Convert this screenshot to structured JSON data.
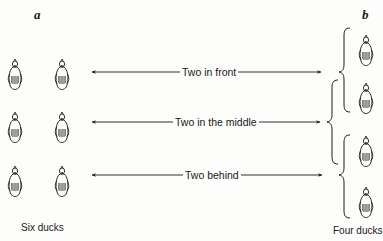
{
  "diagram": {
    "panel_a": {
      "letter": "a",
      "caption": "Six ducks",
      "duck_count": 6
    },
    "panel_b": {
      "letter": "b",
      "caption": "Four ducks",
      "duck_count": 4
    },
    "arrows": [
      {
        "label": "Two in front"
      },
      {
        "label": "Two in the middle"
      },
      {
        "label": "Two behind"
      }
    ],
    "colors": {
      "ink": "#1a1a1a",
      "background": "#fdfdfb"
    },
    "icons": {
      "duck": "duck-icon",
      "brace": "curly-brace-icon",
      "arrow": "double-arrow-icon"
    }
  }
}
